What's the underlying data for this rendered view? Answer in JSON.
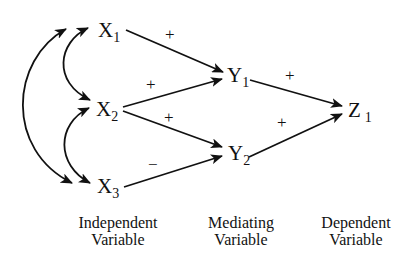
{
  "diagram": {
    "type": "path-model",
    "nodes": [
      {
        "id": "X1",
        "letter": "X",
        "sub": "1",
        "x": 98,
        "y": 37
      },
      {
        "id": "X2",
        "letter": "X",
        "sub": "2",
        "x": 96,
        "y": 116
      },
      {
        "id": "X3",
        "letter": "X",
        "sub": "3",
        "x": 97,
        "y": 193
      },
      {
        "id": "Y1",
        "letter": "Y",
        "sub": "1",
        "x": 227,
        "y": 82
      },
      {
        "id": "Y2",
        "letter": "Y",
        "sub": "2",
        "x": 228,
        "y": 160
      },
      {
        "id": "Z1",
        "letter": "Z",
        "sub": "1",
        "x": 348,
        "y": 117
      }
    ],
    "paths": [
      {
        "from": "X1",
        "to": "Y1",
        "sign": "+"
      },
      {
        "from": "X2",
        "to": "Y1",
        "sign": "+"
      },
      {
        "from": "X2",
        "to": "Y2",
        "sign": "+"
      },
      {
        "from": "X3",
        "to": "Y2",
        "sign": "−"
      },
      {
        "from": "Y1",
        "to": "Z1",
        "sign": "+"
      },
      {
        "from": "Y2",
        "to": "Z1",
        "sign": "+"
      }
    ],
    "correlations": [
      {
        "between": [
          "X1",
          "X2"
        ]
      },
      {
        "between": [
          "X2",
          "X3"
        ]
      },
      {
        "between": [
          "X1",
          "X3"
        ]
      }
    ],
    "signs": {
      "x1_y1": "+",
      "x2_y1": "+",
      "x2_y2": "+",
      "x3_y2": "−",
      "y1_z1": "+",
      "y2_z1": "+"
    },
    "labels": {
      "x1": {
        "letter": "X",
        "sub": "1"
      },
      "x2": {
        "letter": "X",
        "sub": "2"
      },
      "x3": {
        "letter": "X",
        "sub": "3"
      },
      "y1": {
        "letter": "Y",
        "sub": "1"
      },
      "y2": {
        "letter": "Y",
        "sub": "2"
      },
      "z1": {
        "letter": "Z",
        "sub": "1"
      }
    }
  },
  "captions": {
    "independent": {
      "line1": "Independent",
      "line2": "Variable"
    },
    "mediating": {
      "line1": "Mediating",
      "line2": "Variable"
    },
    "dependent": {
      "line1": "Dependent",
      "line2": "Variable"
    }
  }
}
